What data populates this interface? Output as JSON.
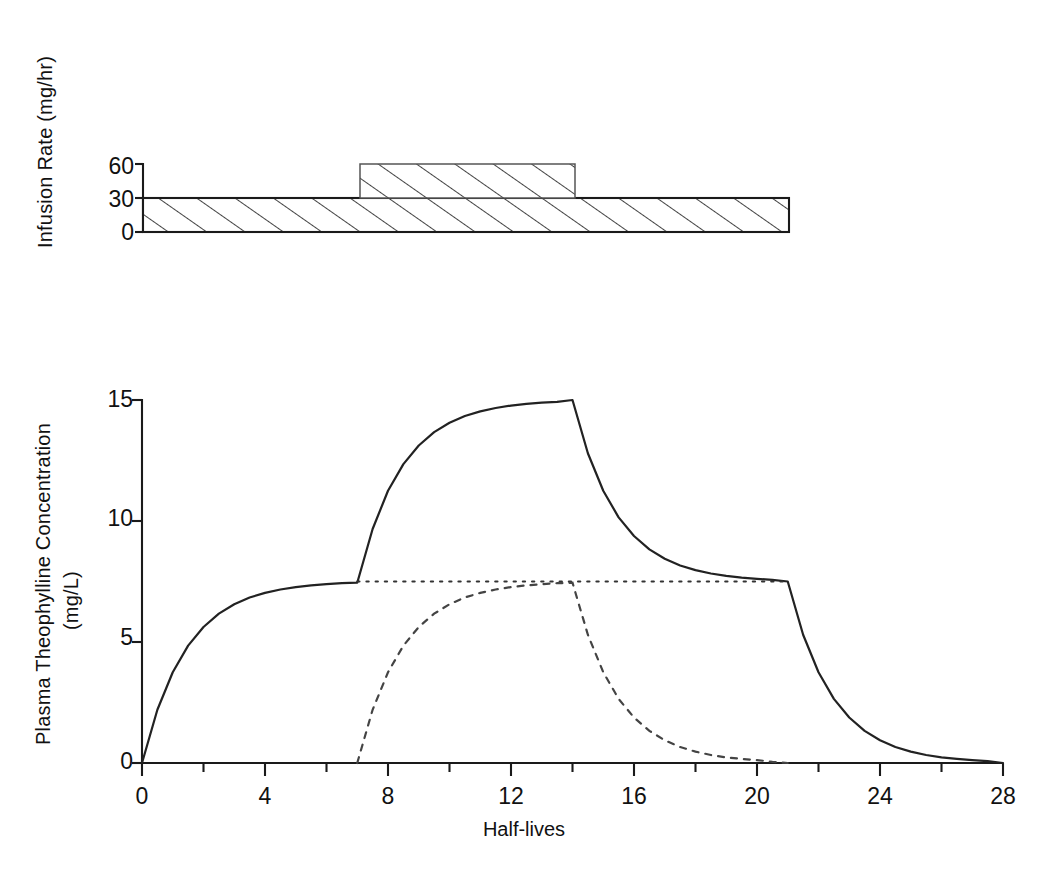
{
  "chart_data": [
    {
      "type": "area",
      "panel": "top",
      "title": "",
      "xlabel": "",
      "ylabel": "Infusion Rate (mg/hr)",
      "ylim": [
        0,
        60
      ],
      "xlim": [
        0,
        28
      ],
      "yticks": [
        0,
        30,
        60
      ],
      "ytick_labels": [
        "0",
        "30",
        "60"
      ],
      "grid": false,
      "legend": "none",
      "series": [
        {
          "name": "Maintenance infusion",
          "style": "hatched-rectangle",
          "x_start": 0,
          "x_end": 21,
          "y_bottom": 0,
          "y_top": 30
        },
        {
          "name": "Increased infusion",
          "style": "hatched-rectangle",
          "x_start": 7,
          "x_end": 14,
          "y_bottom": 30,
          "y_top": 60
        }
      ]
    },
    {
      "type": "line",
      "panel": "bottom",
      "title": "",
      "xlabel": "Half-lives",
      "ylabel": "Plasma Theophylline Concentration (mg/L)",
      "ylim": [
        0,
        15
      ],
      "xlim": [
        0,
        28
      ],
      "yticks": [
        0,
        5,
        10,
        15
      ],
      "ytick_labels": [
        "0",
        "5",
        "10",
        "15"
      ],
      "xticks": [
        0,
        4,
        8,
        12,
        16,
        20,
        24,
        28
      ],
      "xtick_labels": [
        "0",
        "4",
        "8",
        "12",
        "16",
        "20",
        "24",
        "28"
      ],
      "xminor_ticks": [
        2,
        6,
        10,
        14,
        18,
        22,
        26
      ],
      "grid": false,
      "legend": "none",
      "annotations": {
        "steady_state_concentration": 7.5,
        "peak_concentration": 15,
        "infusion_increase_time": 7,
        "infusion_decrease_time": 14,
        "infusion_stop_time": 21
      },
      "series": [
        {
          "name": "Total plasma concentration",
          "style": "solid",
          "color": "#222222",
          "x": [
            0,
            0.5,
            1,
            1.5,
            2,
            2.5,
            3,
            3.5,
            4,
            4.5,
            5,
            5.5,
            6,
            6.5,
            7,
            7,
            7.5,
            8,
            8.5,
            9,
            9.5,
            10,
            10.5,
            11,
            11.5,
            12,
            12.5,
            13,
            13.5,
            14,
            14,
            14.5,
            15,
            15.5,
            16,
            16.5,
            17,
            17.5,
            18,
            18.5,
            19,
            19.5,
            20,
            20.5,
            21,
            21,
            21.5,
            22,
            22.5,
            23,
            23.5,
            24,
            24.5,
            25,
            25.5,
            26,
            26.5,
            27,
            27.5,
            28
          ],
          "y": [
            0,
            2.2,
            3.75,
            4.85,
            5.62,
            6.17,
            6.56,
            6.84,
            7.03,
            7.17,
            7.27,
            7.34,
            7.39,
            7.43,
            7.45,
            7.45,
            9.67,
            11.25,
            12.35,
            13.12,
            13.67,
            14.06,
            14.34,
            14.53,
            14.67,
            14.77,
            14.84,
            14.89,
            14.92,
            15.0,
            15.0,
            12.8,
            11.25,
            10.15,
            9.38,
            8.83,
            8.44,
            8.16,
            7.97,
            7.83,
            7.73,
            7.66,
            7.61,
            7.57,
            7.5,
            7.5,
            5.3,
            3.75,
            2.65,
            1.88,
            1.33,
            0.94,
            0.66,
            0.47,
            0.33,
            0.23,
            0.17,
            0.12,
            0.08,
            0.0
          ]
        },
        {
          "name": "Steady-state level from maintenance infusion",
          "style": "dotted",
          "color": "#333333",
          "x": [
            7,
            21
          ],
          "y": [
            7.5,
            7.5
          ]
        },
        {
          "name": "Contribution from increased infusion",
          "style": "dashed",
          "color": "#444444",
          "x": [
            7,
            7.5,
            8,
            8.5,
            9,
            9.5,
            10,
            10.5,
            11,
            11.5,
            12,
            12.5,
            13,
            13.5,
            14,
            14.5,
            15,
            15.5,
            16,
            16.5,
            17,
            17.5,
            18,
            18.5,
            19,
            19.5,
            20,
            20.5,
            21
          ],
          "y": [
            0,
            2.2,
            3.75,
            4.85,
            5.62,
            6.17,
            6.56,
            6.84,
            7.03,
            7.17,
            7.27,
            7.34,
            7.39,
            7.43,
            7.45,
            5.3,
            3.75,
            2.65,
            1.88,
            1.33,
            0.94,
            0.66,
            0.47,
            0.33,
            0.23,
            0.17,
            0.12,
            0.05,
            0.0
          ]
        }
      ]
    }
  ],
  "top_panel": {
    "ylabel": "Infusion Rate (mg/hr)",
    "ytick_labels": [
      "60",
      "30",
      "0"
    ]
  },
  "bottom_panel": {
    "ylabel_line1": "Plasma Theophylline Concentration",
    "ylabel_line2": "(mg/L)",
    "xlabel": "Half-lives",
    "ytick_labels": [
      "15",
      "10",
      "5",
      "0"
    ],
    "xtick_labels": [
      "0",
      "4",
      "8",
      "12",
      "16",
      "20",
      "24",
      "28"
    ]
  },
  "colors": {
    "axis": "#1a1a1a",
    "curve": "#222222",
    "hatch": "#3a3a3a",
    "text": "#111111"
  }
}
